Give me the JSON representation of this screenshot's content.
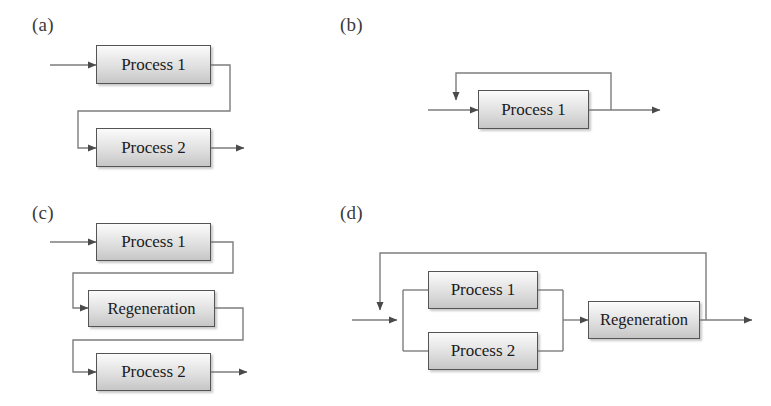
{
  "figure": {
    "background_color": "#ffffff",
    "line_color": "#7d7d7d",
    "arrow_color": "#4a4a4a",
    "box_border_color": "#545454",
    "box_fill_top": "#fbfbfb",
    "box_fill_bottom": "#c6c6c6",
    "label_color": "#3a3a3a"
  },
  "panels": [
    {
      "id": "a",
      "label": "(a)",
      "description": "Two processes in series with offset routing",
      "boxes": [
        {
          "name": "process-1",
          "label": "Process 1"
        },
        {
          "name": "process-2",
          "label": "Process 2"
        }
      ]
    },
    {
      "id": "b",
      "label": "(b)",
      "description": "Single process with recycle loop",
      "boxes": [
        {
          "name": "process-1",
          "label": "Process 1"
        }
      ]
    },
    {
      "id": "c",
      "label": "(c)",
      "description": "Process 1 then Regeneration then Process 2 in series",
      "boxes": [
        {
          "name": "process-1",
          "label": "Process 1"
        },
        {
          "name": "regeneration",
          "label": "Regeneration"
        },
        {
          "name": "process-2",
          "label": "Process 2"
        }
      ]
    },
    {
      "id": "d",
      "label": "(d)",
      "description": "Parallel processes feeding regeneration with recycle loop",
      "boxes": [
        {
          "name": "process-1",
          "label": "Process 1"
        },
        {
          "name": "process-2",
          "label": "Process 2"
        },
        {
          "name": "regeneration",
          "label": "Regeneration"
        }
      ]
    }
  ]
}
